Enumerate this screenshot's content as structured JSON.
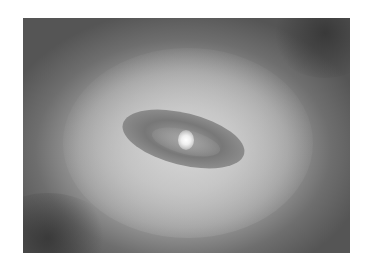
{
  "image": {
    "subject": "grayscale photo of a galaxy core with dark dust disk and bright nucleus",
    "colors": {
      "background": "#ffffff",
      "outer_dark": "#555555",
      "halo": "#c9c9c9",
      "dust_disk": "#696969",
      "nucleus": "#ffffff"
    }
  }
}
